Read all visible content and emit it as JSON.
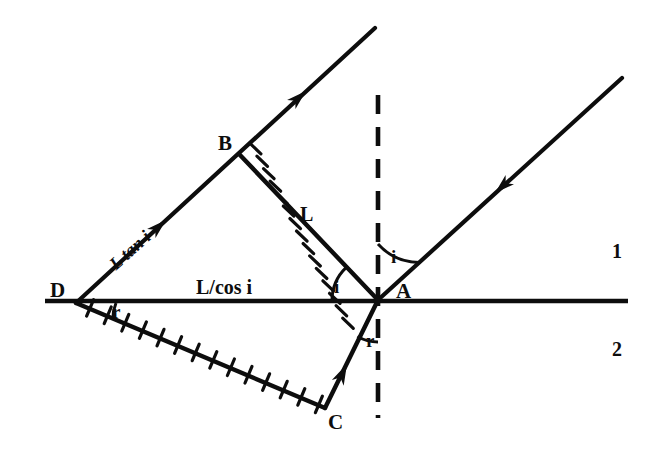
{
  "figure": {
    "background_color": "#ffffff",
    "ink_color": "#0d0d0d"
  },
  "points": {
    "A": {
      "label": "A",
      "x": 378,
      "y": 300,
      "label_x": 396,
      "label_y": 281
    },
    "B": {
      "label": "B",
      "x": 240,
      "y": 155,
      "label_x": 218,
      "label_y": 133
    },
    "C": {
      "label": "C",
      "x": 325,
      "y": 408,
      "label_x": 328,
      "label_y": 412
    },
    "D": {
      "label": "D",
      "x": 76,
      "y": 303,
      "label_x": 50,
      "label_y": 280
    }
  },
  "angles": {
    "incidence_right": {
      "label": "i",
      "x": 391,
      "y": 247
    },
    "incidence_left": {
      "label": "i",
      "x": 334,
      "y": 277
    },
    "refraction_at_A": {
      "label": "r",
      "x": 366,
      "y": 331
    },
    "refraction_at_D": {
      "label": "r",
      "x": 112,
      "y": 302
    }
  },
  "lengths": {
    "wavefront_BA": {
      "label": "L",
      "x": 300,
      "y": 204
    },
    "interface_DA": {
      "label": "L/cos i",
      "x": 196,
      "y": 277
    },
    "ray_DB": {
      "label": "L tan i",
      "x": 118,
      "y": 255,
      "rotation_deg": -42
    }
  },
  "media": {
    "upper": {
      "label": "1",
      "x": 612,
      "y": 241
    },
    "lower": {
      "label": "2",
      "x": 612,
      "y": 339
    }
  },
  "geometry": {
    "interface": {
      "x1": 45,
      "y1": 301,
      "x2": 628,
      "y2": 301,
      "stroke_width": 4.5
    },
    "normal_dashed": {
      "x": 378,
      "y1": 95,
      "y2": 418,
      "dash": "19 13",
      "stroke_width": 4.5
    },
    "incident_ray_right": {
      "x1": 622,
      "y1": 78,
      "x2": 378,
      "y2": 300,
      "arrow_t": 0.52
    },
    "incident_ray_left": {
      "x1": 375,
      "y1": 28,
      "x2": 76,
      "y2": 303,
      "arrow_t": 0.52
    },
    "wavefront_BA": {
      "x1": 240,
      "y1": 155,
      "x2": 378,
      "y2": 300,
      "ticks": 9
    },
    "wavefront_DC": {
      "x1": 76,
      "y1": 303,
      "x2": 325,
      "y2": 408,
      "ticks": 14
    },
    "refracted_ray_AC": {
      "x1": 378,
      "y1": 300,
      "x2": 325,
      "y2": 408,
      "arrow_t": 0.56
    }
  },
  "arcs": {
    "incidence_right": {
      "cx": 378,
      "cy": 300,
      "r": 56
    },
    "incidence_left": {
      "cx": 378,
      "cy": 300,
      "r": 46
    },
    "refraction_at_A": {
      "cx": 378,
      "cy": 300,
      "r": 42
    },
    "refraction_at_D": {
      "cx": 76,
      "cy": 303,
      "r": 40
    }
  }
}
